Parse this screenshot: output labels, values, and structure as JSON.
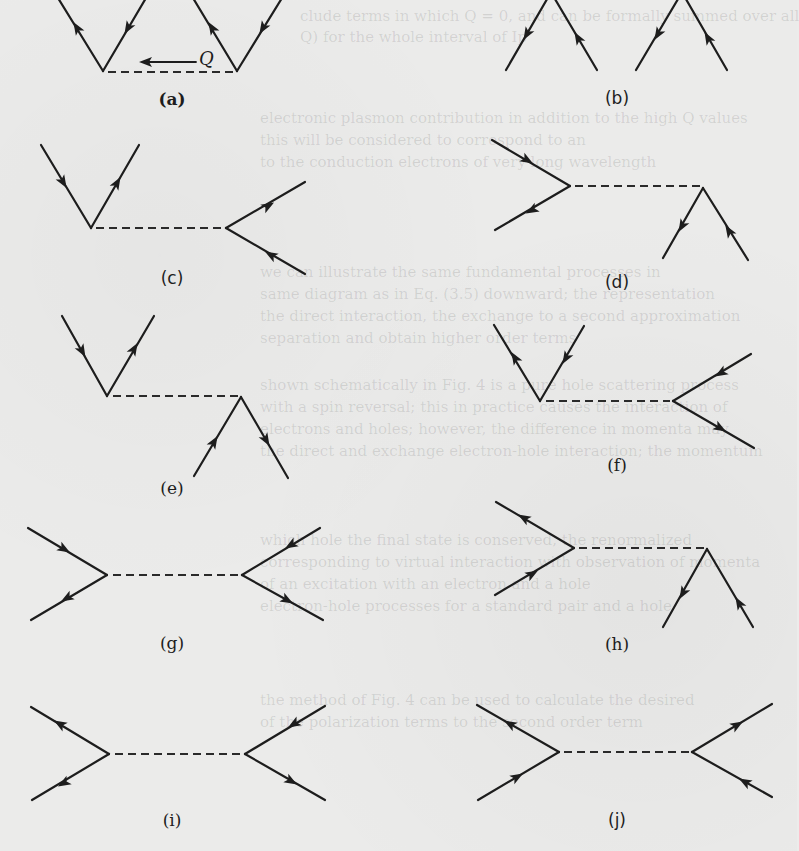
{
  "figure": {
    "momentum_label": "Q",
    "panels": [
      {
        "id": "a",
        "label": "(a)"
      },
      {
        "id": "b",
        "label": "(b)"
      },
      {
        "id": "c",
        "label": "(c)"
      },
      {
        "id": "d",
        "label": "(d)"
      },
      {
        "id": "e",
        "label": "(e)"
      },
      {
        "id": "f",
        "label": "(f)"
      },
      {
        "id": "g",
        "label": "(g)"
      },
      {
        "id": "h",
        "label": "(h)"
      },
      {
        "id": "i",
        "label": "(i)"
      },
      {
        "id": "j",
        "label": "(j)"
      }
    ]
  },
  "bleed_through": {
    "lines": [
      "clude terms in which Q = 0, and can be formally summed over all",
      "Q) for the whole interval of Ip",
      "electronic plasmon contribution in addition to the high Q values",
      "this will be considered to correspond to an",
      "to the conduction electrons of very long wavelength",
      "we can illustrate the same fundamental processes in",
      "same diagram as in Eq. (3.5) downward; the representation",
      "the direct interaction, the exchange to a second approximation",
      "separation and obtain higher order terms",
      "shown schematically in Fig. 4 is a pure hole scattering process",
      "with a spin reversal; this in practice causes the interaction of",
      "electrons and holes; however, the difference in momenta may",
      "the direct and exchange electron-hole interaction; the momentum",
      "which hole the final state is conserved, the renormalized",
      "corresponding to virtual interaction with observation of momenta",
      "of an excitation with an electron and a hole",
      "electron-hole processes for a standard pair and a hole",
      "the method of Fig. 4 can be used to calculate the desired",
      "of the polarization terms to the second order term"
    ]
  }
}
